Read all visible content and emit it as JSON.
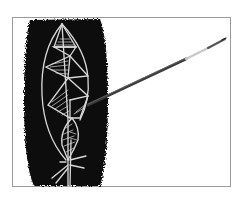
{
  "image": {
    "subject": "Leaf shape drawn in white lines on a black brush-painted panel, with a paintbrush",
    "colors": {
      "background": "#ffffff",
      "paint": "#0a0a0a",
      "line_art": "#d9d9d9",
      "brush_handle": "#3a3a3a",
      "brush_ferrule": "#c8c8c8",
      "frame_border": "#9a9a9a"
    }
  }
}
